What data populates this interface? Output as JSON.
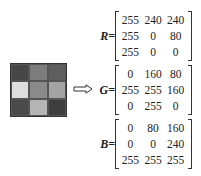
{
  "image_grid": {
    "cells": [
      {
        "color": "#474747"
      },
      {
        "color": "#7c7c7c"
      },
      {
        "color": "#5e5e5e"
      },
      {
        "color": "#dedede"
      },
      {
        "color": "#8a8a8a"
      },
      {
        "color": "#a3a3a3"
      },
      {
        "color": "#4a4a4a"
      },
      {
        "color": "#b5b5b5"
      },
      {
        "color": "#3e3e3e"
      }
    ]
  },
  "arrow": "double-right-arrow",
  "matrices": [
    {
      "label": "R=",
      "rows": [
        [
          "255",
          "240",
          "240"
        ],
        [
          "255",
          "0",
          "80"
        ],
        [
          "255",
          "0",
          "0"
        ]
      ]
    },
    {
      "label": "G=",
      "rows": [
        [
          "0",
          "160",
          "80"
        ],
        [
          "255",
          "255",
          "160"
        ],
        [
          "0",
          "255",
          "0"
        ]
      ]
    },
    {
      "label": "B=",
      "rows": [
        [
          "0",
          "80",
          "160"
        ],
        [
          "0",
          "0",
          "240"
        ],
        [
          "255",
          "255",
          "255"
        ]
      ]
    }
  ]
}
